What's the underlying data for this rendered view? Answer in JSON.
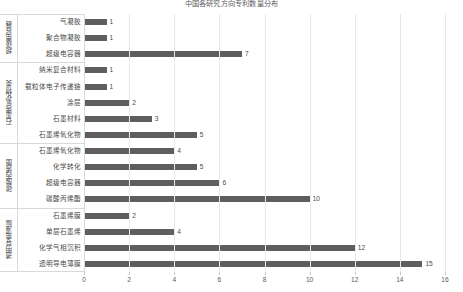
{
  "chart_data": {
    "type": "bar",
    "orientation": "horizontal",
    "title": "中国各研究方向专利数量分布",
    "xlabel": "",
    "ylabel": "",
    "xlim": [
      0,
      16
    ],
    "xticks": [
      0,
      2,
      4,
      6,
      8,
      10,
      12,
      14,
      16
    ],
    "grid": true,
    "legend": false,
    "bar_color": "#5e5e5e",
    "grid_color": "#e8e8e8",
    "axis_color": "#d9d9d9",
    "categories": [
      "气凝胶",
      "聚合物凝胶",
      "超级电容器",
      "纳米复合材料",
      "载粒体电子传递链",
      "涂层",
      "石墨材料",
      "石墨烯氧化物",
      "石墨烯氧化物",
      "化学转化",
      "超级电容器",
      "碳酸丙烯酯",
      "石墨烯膜",
      "单层石墨烯",
      "化学气相沉积",
      "透明导电薄膜"
    ],
    "values": [
      1,
      1,
      7,
      1,
      1,
      2,
      3,
      5,
      4,
      5,
      6,
      10,
      2,
      4,
      12,
      15
    ],
    "groups": [
      {
        "label": "超级电容器",
        "start": 0,
        "count": 3
      },
      {
        "label": "石墨烯氧化物类",
        "start": 3,
        "count": 5
      },
      {
        "label": "碳酸丙烯酯",
        "start": 8,
        "count": 4
      },
      {
        "label": "透明导电薄膜",
        "start": 12,
        "count": 4
      }
    ]
  }
}
